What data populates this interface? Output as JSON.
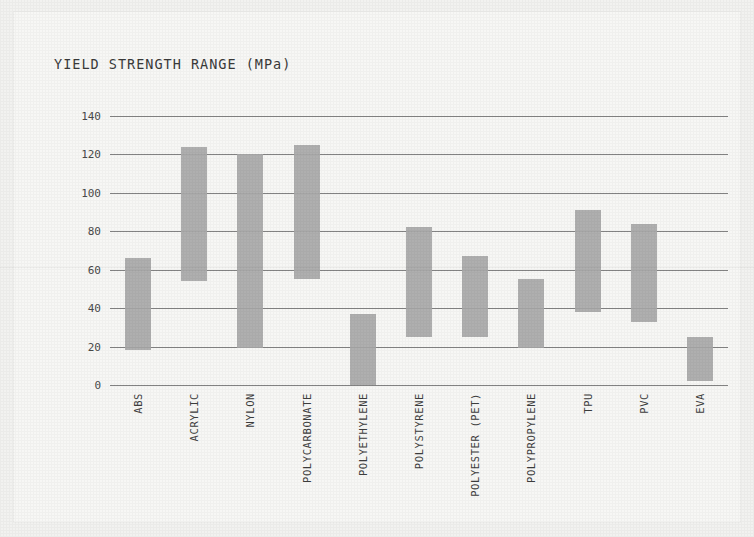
{
  "chart_data": {
    "type": "bar",
    "chart_subtype": "floating-range-bar",
    "title": "YIELD STRENGTH RANGE (MPa)",
    "xlabel": "",
    "ylabel": "",
    "ylim": [
      0,
      140
    ],
    "ytick_step": 20,
    "yticks": [
      "140",
      "120",
      "100",
      "80",
      "60",
      "40",
      "20",
      "0"
    ],
    "grid": true,
    "legend": "none",
    "bar_color": "#a8a8a8",
    "grid_color": "#6e6e6e",
    "background_color": "#f7f7f5",
    "text_color": "#3a3a3a",
    "categories": [
      "ABS",
      "ACRYLIC",
      "NYLON",
      "POLYCARBONATE",
      "POLYETHYLENE",
      "POLYSTYRENE",
      "POLYESTER (PET)",
      "POLYPROPYLENE",
      "TPU",
      "PVC",
      "EVA"
    ],
    "series": [
      {
        "name": "min",
        "values": [
          18,
          54,
          19,
          55,
          0,
          25,
          25,
          19,
          38,
          33,
          2
        ]
      },
      {
        "name": "max",
        "values": [
          66,
          124,
          120,
          125,
          37,
          82,
          67,
          55,
          91,
          84,
          25
        ]
      }
    ],
    "ranges": [
      {
        "category": "ABS",
        "min": 18,
        "max": 66
      },
      {
        "category": "ACRYLIC",
        "min": 54,
        "max": 124
      },
      {
        "category": "NYLON",
        "min": 19,
        "max": 120
      },
      {
        "category": "POLYCARBONATE",
        "min": 55,
        "max": 125
      },
      {
        "category": "POLYETHYLENE",
        "min": 0,
        "max": 37
      },
      {
        "category": "POLYSTYRENE",
        "min": 25,
        "max": 82
      },
      {
        "category": "POLYESTER (PET)",
        "min": 25,
        "max": 67
      },
      {
        "category": "POLYPROPYLENE",
        "min": 19,
        "max": 55
      },
      {
        "category": "TPU",
        "min": 38,
        "max": 91
      },
      {
        "category": "PVC",
        "min": 33,
        "max": 84
      },
      {
        "category": "EVA",
        "min": 2,
        "max": 25
      }
    ]
  }
}
